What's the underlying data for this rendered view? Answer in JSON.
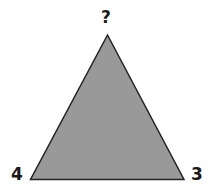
{
  "diagram": {
    "shape": "triangle",
    "fill_color": "#999999",
    "stroke_color": "#222222",
    "vertices": {
      "top": {
        "label": "?"
      },
      "bottom_left": {
        "label": "4"
      },
      "bottom_right": {
        "label": "3"
      }
    }
  }
}
